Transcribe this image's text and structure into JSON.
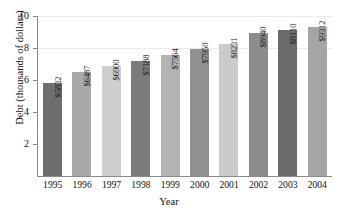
{
  "chart_data": {
    "type": "bar",
    "title": "",
    "xlabel": "Year",
    "ylabel": "Debt (thousands of dollars)",
    "categories": [
      "1995",
      "1996",
      "1997",
      "1998",
      "1999",
      "2000",
      "2001",
      "2002",
      "2003",
      "2004"
    ],
    "values": [
      5.832,
      6.487,
      6.9,
      7.188,
      7.564,
      7.95,
      8.231,
      8.94,
      9.11,
      9.312
    ],
    "data_labels": [
      "$5832",
      "$6487",
      "$6900",
      "$7188",
      "$7564",
      "$7950",
      "$8231",
      "$8940",
      "$9110",
      "$9312"
    ],
    "bar_colors": [
      "#6e6e6e",
      "#a8a8a8",
      "#cfcfcf",
      "#7b7b7b",
      "#b3b3b3",
      "#919191",
      "#cacaca",
      "#8c8c8c",
      "#6a6a6a",
      "#a5a5a5"
    ],
    "ylim": [
      0,
      10
    ],
    "yticks": [
      2,
      4,
      6,
      8,
      10
    ],
    "ytick_labels": [
      "2",
      "4",
      "6",
      "8",
      "10"
    ],
    "grid": true,
    "gridlines_at": [
      8,
      10
    ],
    "legend": "none",
    "axis_color": "#8a8a8a"
  }
}
